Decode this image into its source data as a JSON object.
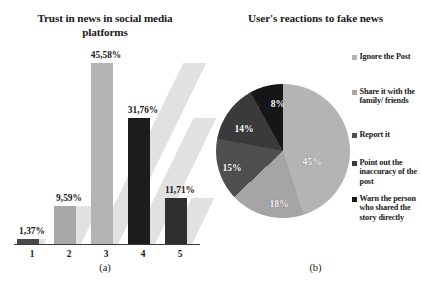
{
  "figure": {
    "panel_a": {
      "title": "Trust in news in social media platforms",
      "caption": "(a)"
    },
    "panel_b": {
      "title": "User's reactions to fake news",
      "caption": "(b)"
    }
  },
  "chart_data": [
    {
      "type": "bar",
      "panel": "(a)",
      "title": "Trust in news in social media platforms",
      "xlabel": "",
      "ylabel": "",
      "categories": [
        "1",
        "2",
        "3",
        "4",
        "5"
      ],
      "values": [
        1.37,
        9.59,
        45.58,
        31.76,
        11.71
      ],
      "value_labels": [
        "1,37%",
        "9,59%",
        "45,58%",
        "31,76%",
        "11,71%"
      ],
      "bar_colors": [
        "#4a4a4a",
        "#a8a8a8",
        "#b4b4b4",
        "#1c1c1c",
        "#303030"
      ],
      "ylim": [
        0,
        50
      ],
      "grid": false,
      "legend": "none"
    },
    {
      "type": "pie",
      "panel": "(b)",
      "title": "User's reactions to fake news",
      "labels": [
        "Ignore the Post",
        "Share it with the family/ friends",
        "Report it",
        "Point out the inaccuracy of the post",
        "Warn the person who shared the story directly"
      ],
      "values": [
        45,
        18,
        15,
        14,
        8
      ],
      "value_labels": [
        "45%",
        "18%",
        "15%",
        "14%",
        "8%"
      ],
      "colors": [
        "#b4b4b4",
        "#a5a5a5",
        "#4f4f4f",
        "#3a3a3a",
        "#161616"
      ],
      "legend_position": "right"
    }
  ],
  "bars": [
    {
      "cat": "1",
      "label": "1,37%",
      "value": 1.37,
      "color": "#4a4a4a",
      "left": 0,
      "height_px": 5,
      "label_top": 179
    },
    {
      "cat": "2",
      "label": "9,59%",
      "value": 9.59,
      "color": "#a8a8a8",
      "left": 37,
      "height_px": 38,
      "label_top": 146
    },
    {
      "cat": "3",
      "label": "45,58%",
      "value": 45.58,
      "color": "#b4b4b4",
      "left": 74,
      "height_px": 181,
      "label_top": 3
    },
    {
      "cat": "4",
      "label": "31,76%",
      "value": 31.76,
      "color": "#1c1c1c",
      "left": 111,
      "height_px": 126,
      "label_top": 58
    },
    {
      "cat": "5",
      "label": "11,71%",
      "value": 11.71,
      "color": "#303030",
      "left": 148,
      "height_px": 46,
      "label_top": 138
    }
  ],
  "pie_slices": [
    {
      "label": "45%",
      "value": 45,
      "color": "#b4b4b4",
      "lx": 96,
      "ly": 77
    },
    {
      "label": "18%",
      "value": 18,
      "color": "#a5a5a5",
      "lx": 63,
      "ly": 119
    },
    {
      "label": "15%",
      "value": 15,
      "color": "#4f4f4f",
      "lx": 16,
      "ly": 83
    },
    {
      "label": "14%",
      "value": 14,
      "color": "#3a3a3a",
      "lx": 28,
      "ly": 44
    },
    {
      "label": "8%",
      "value": 8,
      "color": "#161616",
      "lx": 62,
      "ly": 19
    }
  ],
  "legend_items": [
    {
      "label": "Ignore the Post",
      "color": "#b4b4b4",
      "top": 0
    },
    {
      "label": "Share it with the family/ friends",
      "color": "#a5a5a5",
      "top": 35
    },
    {
      "label": "Report it",
      "color": "#4f4f4f",
      "top": 78
    },
    {
      "label": "Point out the inaccuracy of the post",
      "color": "#3a3a3a",
      "top": 106
    },
    {
      "label": "Warn the person who shared the story directly",
      "color": "#161616",
      "top": 142
    }
  ]
}
